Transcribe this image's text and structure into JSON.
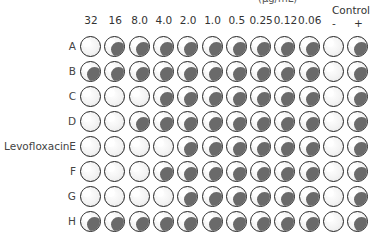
{
  "header": {
    "unit_label_cut": "(μg/mL)",
    "concentration_columns": [
      "32",
      "16",
      "8.0",
      "4.0",
      "2.0",
      "1.0",
      "0.5",
      "0.25",
      "0.12",
      "0.06"
    ],
    "control_title": "Control",
    "control_columns": [
      "-",
      "+"
    ]
  },
  "drug_label": "Levofloxacin",
  "rows": [
    {
      "label": "A",
      "growth": [
        0,
        1,
        1,
        1,
        1,
        1,
        1,
        1,
        1,
        1,
        0,
        1
      ]
    },
    {
      "label": "B",
      "growth": [
        1,
        1,
        1,
        1,
        1,
        1,
        1,
        1,
        1,
        1,
        0,
        1
      ]
    },
    {
      "label": "C",
      "growth": [
        0,
        0,
        0,
        1,
        1,
        1,
        1,
        1,
        1,
        1,
        0,
        1
      ]
    },
    {
      "label": "D",
      "growth": [
        0,
        0,
        1,
        1,
        1,
        1,
        1,
        1,
        1,
        1,
        0,
        1
      ]
    },
    {
      "label": "E",
      "growth": [
        0,
        0,
        0,
        0,
        1,
        1,
        1,
        1,
        1,
        1,
        0,
        1
      ]
    },
    {
      "label": "F",
      "growth": [
        0,
        0,
        0,
        1,
        1,
        1,
        1,
        1,
        1,
        1,
        0,
        1
      ]
    },
    {
      "label": "G",
      "growth": [
        0,
        0,
        0,
        0,
        1,
        1,
        1,
        1,
        1,
        1,
        0,
        1
      ]
    },
    {
      "label": "H",
      "growth": [
        1,
        1,
        1,
        1,
        1,
        1,
        1,
        1,
        1,
        1,
        0,
        1
      ]
    }
  ],
  "colors": {
    "pellet": "#6a6a6a",
    "well_border": "#222222"
  }
}
